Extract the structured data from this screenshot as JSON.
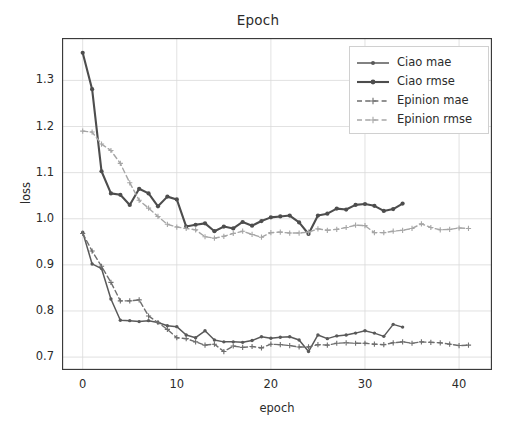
{
  "chart_data": {
    "type": "line",
    "title": "Epoch",
    "xlabel": "epoch",
    "ylabel": "loss",
    "xlim": [
      -2.2,
      43.5
    ],
    "ylim": [
      0.672,
      1.392
    ],
    "xticks": [
      0,
      10,
      20,
      30,
      40
    ],
    "xtick_labels": [
      "0",
      "10",
      "20",
      "30",
      "40"
    ],
    "yticks": [
      0.7,
      0.8,
      0.9,
      1.0,
      1.1,
      1.2,
      1.3
    ],
    "ytick_labels": [
      "0.7",
      "0.8",
      "0.9",
      "1.0",
      "1.1",
      "1.2",
      "1.3"
    ],
    "grid": true,
    "grid_color": "#d9d9d9",
    "legend_position": "upper right",
    "series": [
      {
        "name": "Ciao mae",
        "color": "#595959",
        "linestyle": "solid",
        "linewidth": 1.5,
        "marker": "dot",
        "x": [
          0,
          1,
          2,
          3,
          4,
          5,
          6,
          7,
          8,
          9,
          10,
          11,
          12,
          13,
          14,
          15,
          16,
          17,
          18,
          19,
          20,
          21,
          22,
          23,
          24,
          25,
          26,
          27,
          28,
          29,
          30,
          31,
          32,
          33,
          34
        ],
        "y": [
          0.971,
          0.902,
          0.892,
          0.826,
          0.78,
          0.779,
          0.777,
          0.779,
          0.775,
          0.768,
          0.766,
          0.748,
          0.742,
          0.757,
          0.737,
          0.733,
          0.733,
          0.732,
          0.736,
          0.744,
          0.741,
          0.743,
          0.744,
          0.737,
          0.712,
          0.748,
          0.74,
          0.746,
          0.748,
          0.752,
          0.757,
          0.752,
          0.745,
          0.771,
          0.765
        ]
      },
      {
        "name": "Ciao rmse",
        "color": "#4d4d4d",
        "linestyle": "solid",
        "linewidth": 2.1,
        "marker": "dot",
        "x": [
          0,
          1,
          2,
          3,
          4,
          5,
          6,
          7,
          8,
          9,
          10,
          11,
          12,
          13,
          14,
          15,
          16,
          17,
          18,
          19,
          20,
          21,
          22,
          23,
          24,
          25,
          26,
          27,
          28,
          29,
          30,
          31,
          32,
          33,
          34
        ],
        "y": [
          1.36,
          1.281,
          1.103,
          1.055,
          1.052,
          1.03,
          1.065,
          1.055,
          1.027,
          1.048,
          1.042,
          0.983,
          0.987,
          0.99,
          0.973,
          0.983,
          0.979,
          0.993,
          0.985,
          0.995,
          1.003,
          1.005,
          1.007,
          0.992,
          0.967,
          1.007,
          1.011,
          1.022,
          1.02,
          1.03,
          1.032,
          1.028,
          1.017,
          1.021,
          1.033
        ]
      },
      {
        "name": "Epinion mae",
        "color": "#6e6e6e",
        "linestyle": "dashed",
        "linewidth": 1.4,
        "marker": "plus",
        "x": [
          0,
          1,
          2,
          3,
          4,
          5,
          6,
          7,
          8,
          9,
          10,
          11,
          12,
          13,
          14,
          15,
          16,
          17,
          18,
          19,
          20,
          21,
          22,
          23,
          24,
          25,
          26,
          27,
          28,
          29,
          30,
          31,
          32,
          33,
          34,
          35,
          36,
          37,
          38,
          39,
          40,
          41
        ],
        "y": [
          0.968,
          0.93,
          0.897,
          0.862,
          0.822,
          0.822,
          0.824,
          0.789,
          0.775,
          0.76,
          0.742,
          0.74,
          0.733,
          0.726,
          0.728,
          0.712,
          0.724,
          0.721,
          0.723,
          0.72,
          0.728,
          0.727,
          0.725,
          0.722,
          0.722,
          0.727,
          0.726,
          0.73,
          0.731,
          0.73,
          0.73,
          0.728,
          0.727,
          0.731,
          0.733,
          0.73,
          0.733,
          0.732,
          0.731,
          0.728,
          0.725,
          0.726
        ]
      },
      {
        "name": "Epinion rmse",
        "color": "#a6a6a6",
        "linestyle": "dashed",
        "linewidth": 1.4,
        "marker": "plus",
        "x": [
          0,
          1,
          2,
          3,
          4,
          5,
          6,
          7,
          8,
          9,
          10,
          11,
          12,
          13,
          14,
          15,
          16,
          17,
          18,
          19,
          20,
          21,
          22,
          23,
          24,
          25,
          26,
          27,
          28,
          29,
          30,
          31,
          32,
          33,
          34,
          35,
          36,
          37,
          38,
          39,
          40,
          41
        ],
        "y": [
          1.19,
          1.188,
          1.162,
          1.148,
          1.12,
          1.078,
          1.04,
          1.023,
          1.005,
          0.988,
          0.982,
          0.979,
          0.976,
          0.961,
          0.958,
          0.962,
          0.968,
          0.973,
          0.966,
          0.96,
          0.97,
          0.971,
          0.969,
          0.969,
          0.971,
          0.978,
          0.975,
          0.977,
          0.981,
          0.986,
          0.985,
          0.97,
          0.97,
          0.973,
          0.975,
          0.979,
          0.989,
          0.981,
          0.976,
          0.977,
          0.98,
          0.979
        ]
      }
    ]
  },
  "legend": {
    "items": [
      {
        "label": "Ciao mae"
      },
      {
        "label": "Ciao rmse"
      },
      {
        "label": "Epinion mae"
      },
      {
        "label": "Epinion rmse"
      }
    ]
  }
}
